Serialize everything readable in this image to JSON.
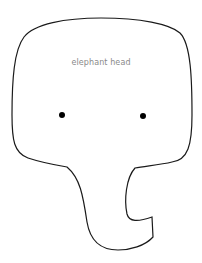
{
  "diagram": {
    "label": "elephant head",
    "stroke_color": "#1a1a1a",
    "eye_color": "#000000",
    "label_color": "#8a8a8a",
    "background": "#ffffff"
  }
}
